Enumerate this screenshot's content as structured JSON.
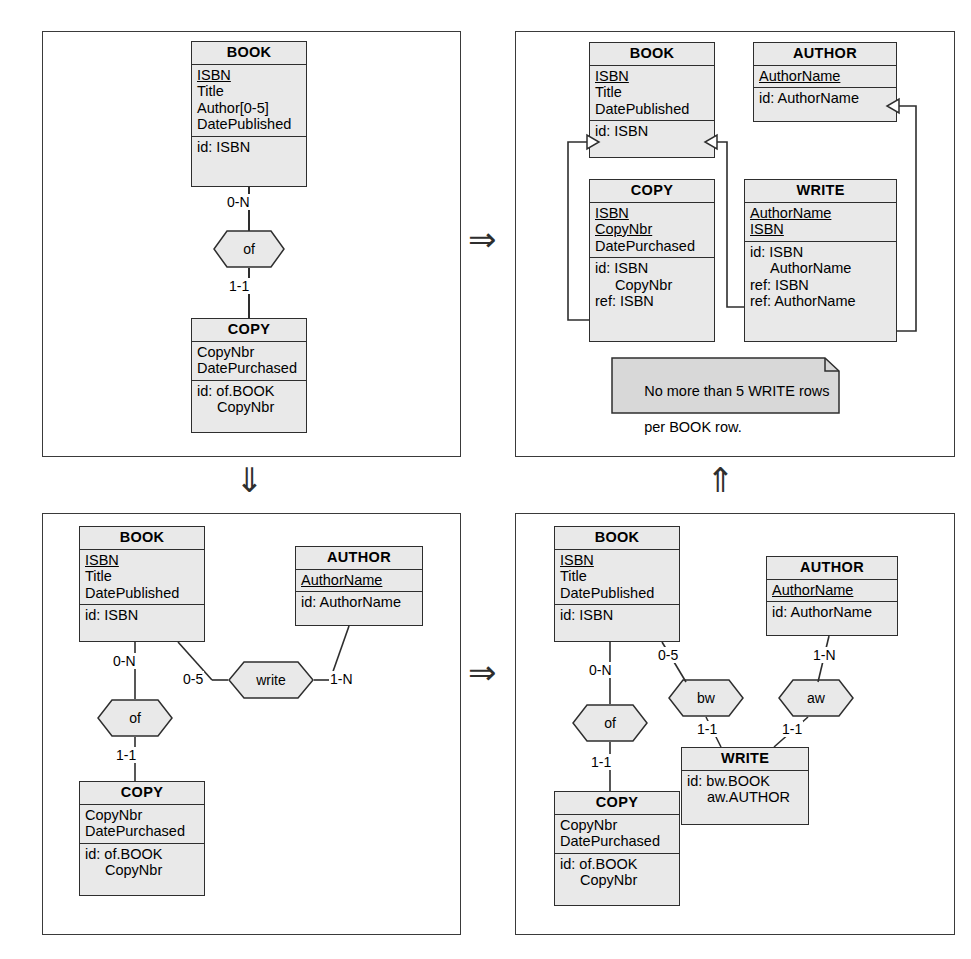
{
  "figure": {
    "arrows": {
      "top_right": "⇒",
      "left_down": "⇓",
      "bottom_right": "⇒",
      "right_up": "⇑"
    }
  },
  "panels": [
    {
      "id": "panel-1",
      "name": "conceptual-schema-with-multivalued-author",
      "boxes": [
        {
          "name": "BOOK",
          "title": "BOOK",
          "attributes": [
            "ISBN",
            "Title",
            "Author[0-5]",
            "DatePublished"
          ],
          "pk_attributes": [
            "ISBN"
          ],
          "identifiers": [
            "id: ISBN"
          ]
        },
        {
          "name": "COPY",
          "title": "COPY",
          "attributes": [
            "CopyNbr",
            "DatePurchased"
          ],
          "pk_attributes": [],
          "identifiers": [
            "id: of.BOOK",
            "      CopyNbr"
          ]
        }
      ],
      "relationships": [
        {
          "name": "of",
          "label": "of",
          "roles": [
            {
              "entity": "BOOK",
              "cardinality": "0-N"
            },
            {
              "entity": "COPY",
              "cardinality": "1-1"
            }
          ]
        }
      ],
      "notes": []
    },
    {
      "id": "panel-2",
      "name": "relational-logical-schema",
      "boxes": [
        {
          "name": "BOOK",
          "title": "BOOK",
          "attributes": [
            "ISBN",
            "Title",
            "DatePublished"
          ],
          "pk_attributes": [
            "ISBN"
          ],
          "identifiers": [
            "id: ISBN"
          ]
        },
        {
          "name": "AUTHOR",
          "title": "AUTHOR",
          "attributes": [
            "AuthorName"
          ],
          "pk_attributes": [
            "AuthorName"
          ],
          "identifiers": [
            "id: AuthorName"
          ]
        },
        {
          "name": "COPY",
          "title": "COPY",
          "attributes": [
            "ISBN",
            "CopyNbr",
            "DatePurchased"
          ],
          "pk_attributes": [
            "ISBN",
            "CopyNbr"
          ],
          "identifiers": [
            "id: ISBN",
            "      CopyNbr",
            "ref: ISBN"
          ]
        },
        {
          "name": "WRITE",
          "title": "WRITE",
          "attributes": [
            "AuthorName",
            "ISBN"
          ],
          "pk_attributes": [
            "AuthorName",
            "ISBN"
          ],
          "identifiers": [
            "id: ISBN",
            "      AuthorName",
            "ref: ISBN",
            "ref: AuthorName"
          ]
        }
      ],
      "relationships": [],
      "notes": [
        {
          "name": "write-cardinality-note",
          "text": "No more than 5 WRITE rows\nper BOOK row."
        }
      ]
    },
    {
      "id": "panel-3",
      "name": "conceptual-schema-with-write-relationship",
      "boxes": [
        {
          "name": "BOOK",
          "title": "BOOK",
          "attributes": [
            "ISBN",
            "Title",
            "DatePublished"
          ],
          "pk_attributes": [
            "ISBN"
          ],
          "identifiers": [
            "id: ISBN"
          ]
        },
        {
          "name": "AUTHOR",
          "title": "AUTHOR",
          "attributes": [
            "AuthorName"
          ],
          "pk_attributes": [
            "AuthorName"
          ],
          "identifiers": [
            "id: AuthorName"
          ]
        },
        {
          "name": "COPY",
          "title": "COPY",
          "attributes": [
            "CopyNbr",
            "DatePurchased"
          ],
          "pk_attributes": [],
          "identifiers": [
            "id: of.BOOK",
            "      CopyNbr"
          ]
        }
      ],
      "relationships": [
        {
          "name": "of",
          "label": "of",
          "roles": [
            {
              "entity": "BOOK",
              "cardinality": "0-N"
            },
            {
              "entity": "COPY",
              "cardinality": "1-1"
            }
          ]
        },
        {
          "name": "write",
          "label": "write",
          "roles": [
            {
              "entity": "BOOK",
              "cardinality": "0-5"
            },
            {
              "entity": "AUTHOR",
              "cardinality": "1-N"
            }
          ]
        }
      ],
      "notes": []
    },
    {
      "id": "panel-4",
      "name": "conceptual-schema-with-write-entity",
      "boxes": [
        {
          "name": "BOOK",
          "title": "BOOK",
          "attributes": [
            "ISBN",
            "Title",
            "DatePublished"
          ],
          "pk_attributes": [
            "ISBN"
          ],
          "identifiers": [
            "id: ISBN"
          ]
        },
        {
          "name": "AUTHOR",
          "title": "AUTHOR",
          "attributes": [
            "AuthorName"
          ],
          "pk_attributes": [
            "AuthorName"
          ],
          "identifiers": [
            "id: AuthorName"
          ]
        },
        {
          "name": "COPY",
          "title": "COPY",
          "attributes": [
            "CopyNbr",
            "DatePurchased"
          ],
          "pk_attributes": [],
          "identifiers": [
            "id: of.BOOK",
            "      CopyNbr"
          ]
        },
        {
          "name": "WRITE",
          "title": "WRITE",
          "attributes": [],
          "pk_attributes": [],
          "identifiers": [
            "id: bw.BOOK",
            "      aw.AUTHOR"
          ]
        }
      ],
      "relationships": [
        {
          "name": "of",
          "label": "of",
          "roles": [
            {
              "entity": "BOOK",
              "cardinality": "0-N"
            },
            {
              "entity": "COPY",
              "cardinality": "1-1"
            }
          ]
        },
        {
          "name": "bw",
          "label": "bw",
          "roles": [
            {
              "entity": "BOOK",
              "cardinality": "0-5"
            },
            {
              "entity": "WRITE",
              "cardinality": "1-1"
            }
          ]
        },
        {
          "name": "aw",
          "label": "aw",
          "roles": [
            {
              "entity": "AUTHOR",
              "cardinality": "1-N"
            },
            {
              "entity": "WRITE",
              "cardinality": "1-1"
            }
          ]
        }
      ],
      "notes": []
    }
  ],
  "labels": {
    "p1_book_title": "BOOK",
    "p1_book_a1": "ISBN",
    "p1_book_a2": "Title",
    "p1_book_a3": "Author[0-5]",
    "p1_book_a4": "DatePublished",
    "p1_book_id": "id: ISBN",
    "p1_of": "of",
    "p1_card_top": "0-N",
    "p1_card_bottom": "1-1",
    "p1_copy_title": "COPY",
    "p1_copy_a1": "CopyNbr",
    "p1_copy_a2": "DatePurchased",
    "p1_copy_id1": "id: of.BOOK",
    "p1_copy_id2": "CopyNbr",
    "p2_book_title": "BOOK",
    "p2_book_a1": "ISBN",
    "p2_book_a2": "Title",
    "p2_book_a3": "DatePublished",
    "p2_book_id": "id: ISBN",
    "p2_author_title": "AUTHOR",
    "p2_author_a1": "AuthorName",
    "p2_author_id": "id: AuthorName",
    "p2_copy_title": "COPY",
    "p2_copy_a1": "ISBN",
    "p2_copy_a2": "CopyNbr",
    "p2_copy_a3": "DatePurchased",
    "p2_copy_id1": "id: ISBN",
    "p2_copy_id2": "CopyNbr",
    "p2_copy_ref": "ref: ISBN",
    "p2_write_title": "WRITE",
    "p2_write_a1": "AuthorName",
    "p2_write_a2": "ISBN",
    "p2_write_id1": "id: ISBN",
    "p2_write_id2": "AuthorName",
    "p2_write_ref1": "ref: ISBN",
    "p2_write_ref2": "ref: AuthorName",
    "p2_note_l1": "No more than 5 WRITE rows",
    "p2_note_l2": "per BOOK row.",
    "p3_book_title": "BOOK",
    "p3_book_a1": "ISBN",
    "p3_book_a2": "Title",
    "p3_book_a3": "DatePublished",
    "p3_book_id": "id: ISBN",
    "p3_author_title": "AUTHOR",
    "p3_author_a1": "AuthorName",
    "p3_author_id": "id: AuthorName",
    "p3_copy_title": "COPY",
    "p3_copy_a1": "CopyNbr",
    "p3_copy_a2": "DatePurchased",
    "p3_copy_id1": "id: of.BOOK",
    "p3_copy_id2": "CopyNbr",
    "p3_of": "of",
    "p3_write": "write",
    "p3_card_of_top": "0-N",
    "p3_card_of_bottom": "1-1",
    "p3_card_write_left": "0-5",
    "p3_card_write_right": "1-N",
    "p4_book_title": "BOOK",
    "p4_book_a1": "ISBN",
    "p4_book_a2": "Title",
    "p4_book_a3": "DatePublished",
    "p4_book_id": "id: ISBN",
    "p4_author_title": "AUTHOR",
    "p4_author_a1": "AuthorName",
    "p4_author_id": "id: AuthorName",
    "p4_copy_title": "COPY",
    "p4_copy_a1": "CopyNbr",
    "p4_copy_a2": "DatePurchased",
    "p4_copy_id1": "id: of.BOOK",
    "p4_copy_id2": "CopyNbr",
    "p4_write_title": "WRITE",
    "p4_write_id1": "id: bw.BOOK",
    "p4_write_id2": "aw.AUTHOR",
    "p4_of": "of",
    "p4_bw": "bw",
    "p4_aw": "aw",
    "p4_card_of_top": "0-N",
    "p4_card_of_bottom": "1-1",
    "p4_card_bw_top": "0-5",
    "p4_card_bw_bottom": "1-1",
    "p4_card_aw_top": "1-N",
    "p4_card_aw_bottom": "1-1"
  },
  "colors": {
    "box_fill": "#e9e9e9",
    "stroke": "#2e2e2e",
    "panel_stroke": "#3a3a3a",
    "background": "#ffffff"
  }
}
